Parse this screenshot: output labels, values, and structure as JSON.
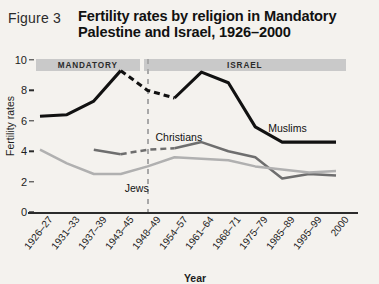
{
  "figure": {
    "label": "Figure 3",
    "title": "Fertility rates by religion in Mandatory Palestine and Israel, 1926–2000"
  },
  "chart_data": {
    "type": "line",
    "title": "Fertility rates by religion in Mandatory Palestine and Israel, 1926–2000",
    "xlabel": "Year",
    "ylabel": "Fertility rates",
    "ylim": [
      0,
      10
    ],
    "yticks": [
      0,
      2,
      4,
      6,
      8,
      10
    ],
    "grid": false,
    "legend_position": "inline-annotations",
    "categories": [
      "1926–27",
      "1931–33",
      "1937–39",
      "1943–45",
      "1948–49",
      "1954–57",
      "1961–64",
      "1968–71",
      "1975–79",
      "1985–89",
      "1995–99",
      "2000"
    ],
    "series": [
      {
        "name": "Muslims",
        "color": "#111111",
        "values": [
          6.3,
          6.4,
          7.3,
          9.3,
          8.0,
          7.5,
          9.2,
          8.5,
          5.6,
          4.6,
          4.6,
          4.6
        ],
        "dashed_segment": [
          "1943–45",
          "1954–57"
        ]
      },
      {
        "name": "Christians",
        "color": "#6e6e6e",
        "values": [
          null,
          null,
          4.1,
          3.8,
          4.1,
          4.2,
          4.6,
          4.0,
          3.6,
          2.2,
          2.5,
          2.4
        ],
        "dashed_segment": [
          "1943–45",
          "1954–57"
        ]
      },
      {
        "name": "Jews",
        "color": "#b0b0b0",
        "values": [
          4.1,
          3.2,
          2.5,
          2.5,
          3.0,
          3.6,
          3.5,
          3.4,
          3.0,
          2.8,
          2.6,
          2.7
        ],
        "dashed_segment": null
      }
    ],
    "annotations": [
      {
        "text": "Muslims",
        "series": "Muslims"
      },
      {
        "text": "Christians",
        "series": "Christians"
      },
      {
        "text": "Jews",
        "series": "Jews"
      }
    ],
    "period_bands": [
      {
        "label": "MANDATORY",
        "from": "1926–27",
        "to": "1948–49",
        "color": "#c9c9c9"
      },
      {
        "label": "ISRAEL",
        "from": "1948–49",
        "to": "2000",
        "color": "#c9c9c9"
      }
    ],
    "divider": {
      "at": "1948–49",
      "style": "dashed",
      "color": "#a8a8a8"
    }
  }
}
